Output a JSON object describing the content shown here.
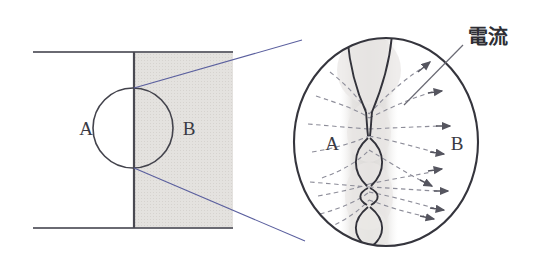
{
  "figure": {
    "kind": "scientific-diagram",
    "width": 541,
    "height": 268,
    "background_color": "#ffffff"
  },
  "colors": {
    "outline": "#3a3a44",
    "shade_fill": "#e2e0dd",
    "plume_fill": "#e6e4e2",
    "dashed_line": "#8d8d99",
    "connector_blue": "#5a5f9e",
    "leader_line": "#6a6a74",
    "text": "#3a3a44"
  },
  "left_panel": {
    "name": "schematic-overview",
    "labels": {
      "region_a": "A",
      "region_b": "B"
    },
    "geometry": {
      "top_rail_y": 52,
      "bottom_rail_y": 228,
      "rail_x_start": 33,
      "rail_x_end": 233,
      "interface_x": 134,
      "shaded_region_x": 134,
      "shaded_region_width": 99,
      "circle_center_x": 133,
      "circle_center_y": 128,
      "circle_radius": 40
    }
  },
  "right_panel": {
    "name": "magnified-view",
    "labels": {
      "region_a": "A",
      "region_b": "B",
      "current": "電流"
    },
    "geometry": {
      "ellipse_center_x": 386,
      "ellipse_center_y": 142,
      "ellipse_rx": 92,
      "ellipse_ry": 104,
      "neck_axis_x": 369,
      "pinch_points_y": [
        112,
        152,
        185,
        205
      ],
      "lens_count": 3
    },
    "current_arrows": 9,
    "dashed_streamlines": 9
  },
  "connectors": {
    "name": "magnifier-connector-lines",
    "upper_from": [
      134,
      88
    ],
    "upper_to": [
      300,
      40
    ],
    "lower_from": [
      134,
      168
    ],
    "lower_to": [
      303,
      240
    ]
  },
  "leader": {
    "name": "current-leader-line",
    "from": [
      463,
      48
    ],
    "to": [
      404,
      104
    ]
  }
}
